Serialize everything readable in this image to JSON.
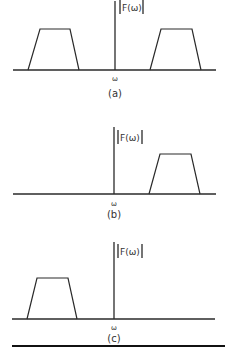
{
  "figure": {
    "panels": [
      {
        "id": "a",
        "caption": "(a)",
        "y_label": "|F(ω)|",
        "x_label": "ω",
        "description": "Two-sided spectrum: trapezoidal bands at negative and positive frequencies"
      },
      {
        "id": "b",
        "caption": "(b)",
        "y_label": "|F(ω)|",
        "x_label": "ω",
        "description": "Positive-frequency band only"
      },
      {
        "id": "c",
        "caption": "(c)",
        "y_label": "|F(ω)|",
        "x_label": "ω",
        "description": "Negative-frequency band only"
      }
    ],
    "labels": {
      "a_caption": "(a)",
      "b_caption": "(b)",
      "c_caption": "(c)",
      "mag": "|F(ω)|",
      "F_text": "F(ω)",
      "omega": "ω"
    }
  }
}
